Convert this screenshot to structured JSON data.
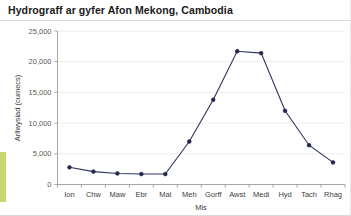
{
  "chart_data": {
    "type": "line",
    "title": "Hydrograff ar gyfer Afon Mekong, Cambodia",
    "xlabel": "Mis",
    "ylabel": "Arllwysiad (cumecs)",
    "categories": [
      "Ion",
      "Chw",
      "Maw",
      "Ebr",
      "Mai",
      "Meh",
      "Gorff",
      "Awst",
      "Medi",
      "Hyd",
      "Tach",
      "Rhag"
    ],
    "values": [
      2800,
      2100,
      1800,
      1700,
      1700,
      7000,
      13800,
      21700,
      21400,
      12000,
      6400,
      3600
    ],
    "series": [
      {
        "name": "Arllwysiad",
        "values": [
          2800,
          2100,
          1800,
          1700,
          1700,
          7000,
          13800,
          21700,
          21400,
          12000,
          6400,
          3600
        ],
        "color": "#2e3360"
      }
    ],
    "ylim": [
      0,
      25000
    ],
    "yticks": [
      0,
      5000,
      10000,
      15000,
      20000,
      25000
    ],
    "ytick_labels": [
      "0",
      "5,000",
      "10,000",
      "15,000",
      "20,000",
      "25,000"
    ],
    "grid": true,
    "legend": "none",
    "marker": "circle"
  },
  "accent_colors": {
    "series": "#2e3360",
    "marker": "#23264d",
    "side_accent": "#c3d96b",
    "gridline": "#ededed",
    "axis": "#a6a6a6"
  }
}
